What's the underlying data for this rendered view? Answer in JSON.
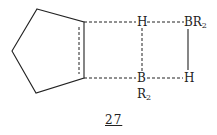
{
  "diagram": {
    "type": "chemical-structure",
    "compound_label": "27",
    "atoms": {
      "h_top": "H",
      "br2_top": {
        "element": "BR",
        "subscript": "2"
      },
      "b_bottom": "B",
      "r2_bottom": {
        "element": "R",
        "subscript": "2"
      },
      "h_bottom": "H"
    },
    "ring": "cyclopentene",
    "bonds": [
      {
        "from": "ring-C1",
        "to": "H (top)",
        "style": "dashed"
      },
      {
        "from": "ring-C2",
        "to": "B",
        "style": "dashed"
      },
      {
        "from": "H (top)",
        "to": "B",
        "style": "dashed"
      },
      {
        "from": "H (top)",
        "to": "BR2",
        "style": "dashed"
      },
      {
        "from": "B",
        "to": "H (bottom)",
        "style": "dashed"
      },
      {
        "from": "BR2",
        "to": "H (bottom)",
        "style": "solid"
      },
      {
        "from": "ring-C1",
        "to": "ring-C2",
        "style": "partial double (dashed inner)"
      }
    ],
    "colors": {
      "line": "#222222",
      "background": "#ffffff"
    }
  }
}
